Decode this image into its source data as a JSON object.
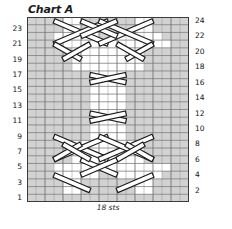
{
  "chart": {
    "title": "Chart A",
    "caption": "18 sts",
    "stitch_count": 18,
    "row_count": 24
  },
  "row_labels": {
    "left": [
      "23",
      "21",
      "19",
      "17",
      "15",
      "13",
      "11",
      "9",
      "7",
      "5",
      "3",
      "1"
    ],
    "right": [
      "24",
      "22",
      "20",
      "18",
      "16",
      "14",
      "12",
      "10",
      "8",
      "6",
      "4",
      "2"
    ]
  },
  "colors": {
    "grid_line": "#6e6e6e",
    "grid_line_minor": "#9a9a9a",
    "border": "#3c3c3c",
    "shaded_cell": "#d2d2d2",
    "empty_cell": "#ffffff",
    "symbol_stroke": "#1a1a1a",
    "symbol_fill": "#ffffff",
    "text": "#131313"
  },
  "chart_data": {
    "type": "heatmap",
    "title": "Chart A",
    "xlabel": "18 sts",
    "ylabel": "",
    "columns": 18,
    "rows": 24,
    "grid": true,
    "legend": "none",
    "x_tick_labels": [],
    "y_tick_labels_left": [
      "1",
      "3",
      "5",
      "7",
      "9",
      "11",
      "13",
      "15",
      "17",
      "19",
      "21",
      "23"
    ],
    "y_tick_labels_right": [
      "2",
      "4",
      "6",
      "8",
      "10",
      "12",
      "14",
      "16",
      "18",
      "20",
      "22",
      "24"
    ],
    "cell_legend": {
      "shaded": "purl stitch (reverse stockinette background)",
      "blank": "knit stitch (stockinette cable column)",
      "diagonal": "cable cross travelling stitch"
    },
    "shaded_cells": [
      {
        "row": 1,
        "cols": [
          1,
          2,
          3,
          4,
          5,
          6,
          7,
          8,
          9,
          10,
          11,
          12,
          13,
          14,
          15,
          16,
          17,
          18
        ]
      },
      {
        "row": 2,
        "cols": [
          1,
          2,
          3,
          4,
          7,
          8,
          9,
          10,
          11,
          12,
          15,
          16,
          17,
          18
        ]
      },
      {
        "row": 3,
        "cols": [
          1,
          2,
          3,
          4,
          7,
          8,
          9,
          10,
          11,
          12,
          15,
          16,
          17,
          18
        ]
      },
      {
        "row": 4,
        "cols": [
          1,
          2,
          3,
          9,
          10,
          16,
          17,
          18
        ]
      },
      {
        "row": 5,
        "cols": [
          1,
          2,
          3,
          17,
          18
        ]
      },
      {
        "row": 6,
        "cols": [
          1,
          2,
          3,
          4,
          5,
          14,
          15,
          16,
          17,
          18
        ]
      },
      {
        "row": 7,
        "cols": [
          1,
          2,
          3,
          4,
          5,
          14,
          15,
          16,
          17,
          18
        ]
      },
      {
        "row": 8,
        "cols": [
          1,
          2,
          3,
          4,
          5,
          14,
          15,
          16,
          17,
          18
        ]
      },
      {
        "row": 9,
        "cols": [
          1,
          2,
          3,
          4,
          5,
          6,
          7,
          12,
          13,
          14,
          15,
          16,
          17,
          18
        ]
      },
      {
        "row": 10,
        "cols": [
          1,
          2,
          3,
          4,
          5,
          6,
          7,
          12,
          13,
          14,
          15,
          16,
          17,
          18
        ]
      },
      {
        "row": 11,
        "cols": [
          1,
          2,
          3,
          4,
          5,
          6,
          7,
          12,
          13,
          14,
          15,
          16,
          17,
          18
        ]
      },
      {
        "row": 12,
        "cols": [
          1,
          2,
          3,
          4,
          5,
          6,
          7,
          12,
          13,
          14,
          15,
          16,
          17,
          18
        ]
      },
      {
        "row": 13,
        "cols": [
          1,
          2,
          3,
          4,
          5,
          6,
          7,
          12,
          13,
          14,
          15,
          16,
          17,
          18
        ]
      },
      {
        "row": 14,
        "cols": [
          1,
          2,
          3,
          4,
          5,
          6,
          7,
          12,
          13,
          14,
          15,
          16,
          17,
          18
        ]
      },
      {
        "row": 15,
        "cols": [
          1,
          2,
          3,
          4,
          5,
          6,
          7,
          12,
          13,
          14,
          15,
          16,
          17,
          18
        ]
      },
      {
        "row": 16,
        "cols": [
          1,
          2,
          3,
          4,
          5,
          6,
          7,
          12,
          13,
          14,
          15,
          16,
          17,
          18
        ]
      },
      {
        "row": 17,
        "cols": [
          1,
          2,
          3,
          4,
          5,
          6,
          7,
          12,
          13,
          14,
          15,
          16,
          17,
          18
        ]
      },
      {
        "row": 18,
        "cols": [
          1,
          2,
          3,
          4,
          5,
          14,
          15,
          16,
          17,
          18
        ]
      },
      {
        "row": 19,
        "cols": [
          1,
          2,
          3,
          4,
          5,
          14,
          15,
          16,
          17,
          18
        ]
      },
      {
        "row": 20,
        "cols": [
          1,
          2,
          3,
          4,
          5,
          14,
          15,
          16,
          17,
          18
        ]
      },
      {
        "row": 21,
        "cols": [
          1,
          2,
          3,
          17,
          18
        ]
      },
      {
        "row": 22,
        "cols": [
          1,
          2,
          3,
          9,
          10,
          16,
          17,
          18
        ]
      },
      {
        "row": 23,
        "cols": [
          1,
          2,
          3,
          4,
          7,
          8,
          9,
          10,
          11,
          12,
          15,
          16,
          17,
          18
        ]
      },
      {
        "row": 24,
        "cols": [
          1,
          2,
          3,
          4,
          7,
          8,
          9,
          10,
          11,
          12,
          15,
          16,
          17,
          18
        ]
      }
    ]
  }
}
